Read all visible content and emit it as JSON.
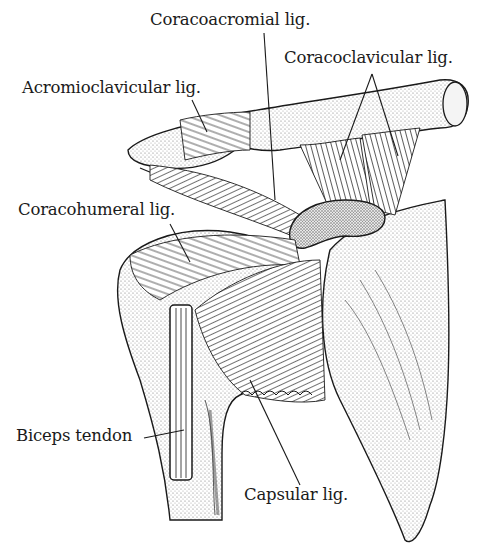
{
  "figure": {
    "colors": {
      "ink": "#1a1a1a",
      "paper": "#ffffff",
      "stipple": "#8a8a8a"
    }
  },
  "labels": [
    {
      "id": "coracoacromial",
      "text": "Coracoacromial lig.",
      "x": 150,
      "y": 12
    },
    {
      "id": "coracoclavicular",
      "text": "Coracoclavicular lig.",
      "x": 284,
      "y": 50
    },
    {
      "id": "acromioclavicular",
      "text": "Acromioclavicular lig.",
      "x": 22,
      "y": 80
    },
    {
      "id": "coracohumeral",
      "text": "Coracohumeral lig.",
      "x": 18,
      "y": 202
    },
    {
      "id": "biceps",
      "text": "Biceps tendon",
      "x": 16,
      "y": 428
    },
    {
      "id": "capsular",
      "text": "Capsular lig.",
      "x": 244,
      "y": 487
    }
  ]
}
